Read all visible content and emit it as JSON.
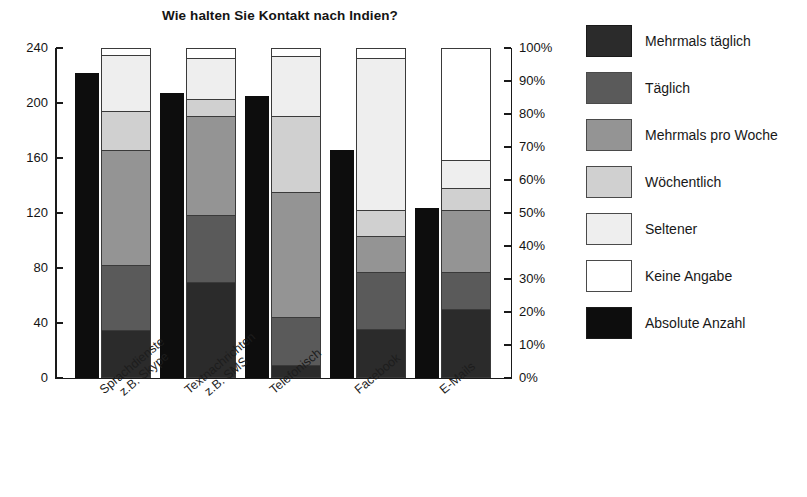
{
  "chart_data": {
    "type": "bar",
    "title": "Wie halten Sie Kontakt nach Indien?",
    "subtitle": "",
    "xlabel": "",
    "ylabel": "",
    "grid": false,
    "legend_position": "right",
    "stacked": true,
    "normalized": true,
    "categories": [
      "Sprachdienste\nz.B. Skype",
      "Textnachrichten\nz.B. SMS",
      "Telefonisch",
      "Facebook",
      "E-Mails"
    ],
    "category_lines": [
      [
        "Sprachdienste",
        "z.B. Skype"
      ],
      [
        "Textnachrichten",
        "z.B. SMS"
      ],
      [
        "Telefonisch",
        ""
      ],
      [
        "Facebook",
        ""
      ],
      [
        "E-Mails",
        ""
      ]
    ],
    "left_axis": {
      "label": "",
      "ticks": [
        240,
        200,
        160,
        120,
        80,
        40,
        0
      ],
      "tick_labels": [
        "240",
        "200",
        "160",
        "120",
        "80",
        "40",
        "0"
      ],
      "ylim": [
        0,
        240
      ]
    },
    "right_axis": {
      "label": "",
      "ticks": [
        100,
        90,
        80,
        70,
        60,
        50,
        40,
        30,
        20,
        10,
        0
      ],
      "tick_labels": [
        "100%",
        "90%",
        "80%",
        "70%",
        "60%",
        "50%",
        "40%",
        "30%",
        "20%",
        "10%",
        "0%"
      ],
      "ylim": [
        0,
        100
      ]
    },
    "series": [
      {
        "name": "Mehrmals täglich",
        "color": "#2b2b2b",
        "values": [
          14.5,
          29.0,
          4.0,
          15.0,
          21.0
        ]
      },
      {
        "name": "Täglich",
        "color": "#5a5a5a",
        "values": [
          19.7,
          20.5,
          14.5,
          17.0,
          11.0
        ]
      },
      {
        "name": "Mehrmals pro Woche",
        "color": "#949494",
        "values": [
          34.8,
          30.0,
          38.0,
          11.0,
          19.0
        ]
      },
      {
        "name": "Wöchentlich",
        "color": "#d0d0d0",
        "values": [
          12.0,
          5.0,
          23.0,
          8.0,
          6.5
        ]
      },
      {
        "name": "Seltener",
        "color": "#eeeeee",
        "values": [
          17.0,
          12.5,
          18.0,
          46.0,
          8.5
        ]
      },
      {
        "name": "Keine Angabe",
        "color": "#ffffff",
        "values": [
          2.0,
          3.0,
          2.5,
          3.0,
          34.0
        ]
      }
    ],
    "absolute_counts": {
      "name": "Absolute Anzahl",
      "color": "#0d0d0d",
      "values": [
        222,
        207,
        205,
        166,
        124
      ]
    }
  },
  "legend": {
    "items": [
      {
        "label": "Mehrmals täglich",
        "color": "#2b2b2b"
      },
      {
        "label": "Täglich",
        "color": "#5a5a5a"
      },
      {
        "label": "Mehrmals pro Woche",
        "color": "#949494"
      },
      {
        "label": "Wöchentlich",
        "color": "#d0d0d0"
      },
      {
        "label": "Seltener",
        "color": "#eeeeee"
      },
      {
        "label": "Keine Angabe",
        "color": "#ffffff"
      },
      {
        "label": "Absolute Anzahl",
        "color": "#0d0d0d"
      }
    ]
  }
}
